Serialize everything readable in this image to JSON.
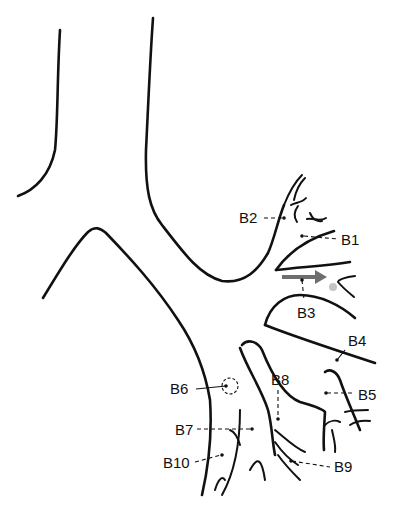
{
  "diagram": {
    "type": "bronchial tree (left lung segmental bronchi)",
    "labels": [
      {
        "id": "B1",
        "text": "B1",
        "x": 341,
        "y": 232
      },
      {
        "id": "B2",
        "text": "B2",
        "x": 239,
        "y": 210
      },
      {
        "id": "B3",
        "text": "B3",
        "x": 299,
        "y": 305
      },
      {
        "id": "B4",
        "text": "B4",
        "x": 348,
        "y": 333
      },
      {
        "id": "B5",
        "text": "B5",
        "x": 358,
        "y": 388
      },
      {
        "id": "B6",
        "text": "B6",
        "x": 170,
        "y": 376
      },
      {
        "id": "B7",
        "text": "B7",
        "x": 175,
        "y": 422
      },
      {
        "id": "B8",
        "text": "B8",
        "x": 271,
        "y": 372
      },
      {
        "id": "B9",
        "text": "B9",
        "x": 334,
        "y": 459
      },
      {
        "id": "B10",
        "text": "B10",
        "x": 163,
        "y": 458
      }
    ],
    "markers": {
      "arrow": {
        "color": "#6e6e6e",
        "description": "grey arrow pointing into B3"
      },
      "target_dot": {
        "color": "#c4c4c4",
        "description": "grey dot at B3 subsegment"
      },
      "dashed_circle": {
        "description": "dashed circle marking B6 origin"
      }
    }
  }
}
